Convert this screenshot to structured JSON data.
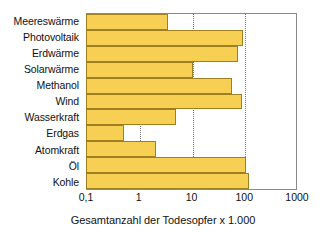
{
  "chart_data": {
    "type": "bar",
    "orientation": "horizontal",
    "title": "",
    "xlabel": "Gesamtanzahl der Todesopfer x 1.000",
    "ylabel": "",
    "xscale": "log",
    "xlim": [
      0.1,
      1000
    ],
    "grid": true,
    "legend": null,
    "categories": [
      "Meereswärme",
      "Photovoltaik",
      "Erdwärme",
      "Solarwärme",
      "Methanol",
      "Wind",
      "Wasserkraft",
      "Erdgas",
      "Atomkraft",
      "Öl",
      "Kohle"
    ],
    "values": [
      3.4,
      90,
      72,
      10,
      56,
      86,
      4.8,
      0.5,
      2.0,
      105,
      120
    ],
    "xticks": [
      0.1,
      1,
      10,
      100,
      1000
    ],
    "xticklabels": [
      "0,1",
      "1",
      "10",
      "100",
      "1000"
    ],
    "colors": {
      "bar_fill": "#F7CF52",
      "bar_border": "#9E7F22",
      "axis": "#8A8A8A",
      "gridline": "#7A7A7A",
      "text": "#111111",
      "background": "#FFFFFF"
    }
  }
}
